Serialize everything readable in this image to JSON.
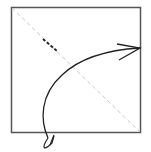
{
  "diagram": {
    "type": "origami-fold-step",
    "paper": {
      "x": 11,
      "y": 7,
      "width": 130,
      "height": 126,
      "stroke": "#555555"
    },
    "fold_line": {
      "style": "valley-dashed",
      "from": [
        11,
        7
      ],
      "to": [
        141,
        133
      ],
      "color": "#c8c8c8"
    },
    "crease_mark": {
      "from": [
        43,
        39
      ],
      "to": [
        57,
        51
      ],
      "color": "#222222"
    },
    "arrow": {
      "meaning": "fold bottom-left corner up to top-right",
      "color": "#222222"
    }
  }
}
